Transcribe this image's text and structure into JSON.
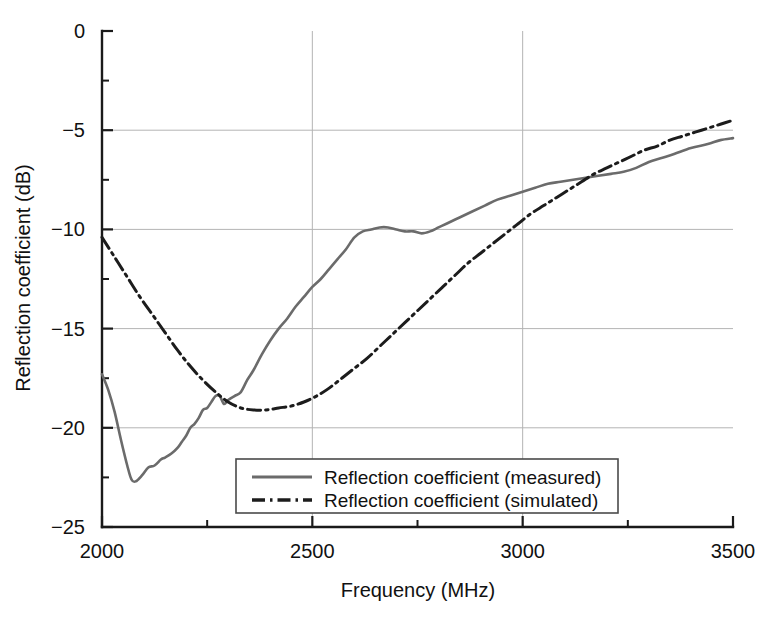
{
  "chart_data": {
    "type": "line",
    "title": "",
    "xlabel": "Frequency (MHz)",
    "ylabel": "Reflection coefficient (dB)",
    "xlim": [
      2000,
      3500
    ],
    "ylim": [
      -25,
      0
    ],
    "xticks": [
      2000,
      2500,
      3000,
      3500
    ],
    "xtick_labels": [
      "2000",
      "2500",
      "3000",
      "3500"
    ],
    "xminor_ticks": [
      2250,
      2750,
      3250
    ],
    "yticks": [
      0,
      -5,
      -10,
      -15,
      -20,
      -25
    ],
    "ytick_labels": [
      "0",
      "−5",
      "−10",
      "−15",
      "−20",
      "−25"
    ],
    "yminor_ticks": [
      -2.5,
      -7.5,
      -12.5,
      -17.5,
      -22.5
    ],
    "grid": true,
    "grid_color": "#b4b4b4",
    "legend_position": "bottom-center",
    "series": [
      {
        "name": "Reflection coefficient (measured)",
        "style": "solid",
        "color": "#6b6b6b",
        "x": [
          2000,
          2015,
          2030,
          2045,
          2060,
          2070,
          2080,
          2095,
          2110,
          2125,
          2140,
          2150,
          2165,
          2180,
          2190,
          2200,
          2210,
          2220,
          2230,
          2240,
          2250,
          2260,
          2270,
          2280,
          2290,
          2300,
          2315,
          2330,
          2345,
          2360,
          2380,
          2400,
          2420,
          2440,
          2460,
          2480,
          2500,
          2520,
          2540,
          2560,
          2580,
          2600,
          2620,
          2640,
          2660,
          2680,
          2700,
          2720,
          2740,
          2760,
          2780,
          2800,
          2820,
          2850,
          2880,
          2910,
          2940,
          2970,
          3000,
          3030,
          3060,
          3090,
          3120,
          3150,
          3180,
          3210,
          3240,
          3270,
          3300,
          3330,
          3360,
          3400,
          3440,
          3470,
          3500
        ],
        "y": [
          -17.3,
          -18.1,
          -19.2,
          -20.6,
          -21.9,
          -22.6,
          -22.7,
          -22.4,
          -22.0,
          -21.9,
          -21.6,
          -21.5,
          -21.3,
          -21.0,
          -20.7,
          -20.4,
          -20.0,
          -19.8,
          -19.5,
          -19.1,
          -19.0,
          -18.7,
          -18.4,
          -18.4,
          -18.8,
          -18.6,
          -18.4,
          -18.2,
          -17.6,
          -17.1,
          -16.3,
          -15.6,
          -15.0,
          -14.5,
          -13.9,
          -13.4,
          -12.9,
          -12.5,
          -12.0,
          -11.5,
          -11.0,
          -10.4,
          -10.1,
          -10.0,
          -9.9,
          -9.9,
          -10.0,
          -10.1,
          -10.1,
          -10.2,
          -10.1,
          -9.9,
          -9.7,
          -9.4,
          -9.1,
          -8.8,
          -8.5,
          -8.3,
          -8.1,
          -7.9,
          -7.7,
          -7.6,
          -7.5,
          -7.4,
          -7.3,
          -7.2,
          -7.1,
          -6.9,
          -6.6,
          -6.4,
          -6.2,
          -5.9,
          -5.7,
          -5.5,
          -5.4
        ]
      },
      {
        "name": "Reflection coefficient (simulated)",
        "style": "dash-dot-dot",
        "color": "#1c1c1c",
        "x": [
          2000,
          2030,
          2060,
          2090,
          2120,
          2150,
          2180,
          2210,
          2240,
          2270,
          2300,
          2330,
          2360,
          2390,
          2420,
          2450,
          2480,
          2510,
          2540,
          2570,
          2600,
          2630,
          2660,
          2690,
          2720,
          2750,
          2780,
          2810,
          2840,
          2870,
          2900,
          2930,
          2960,
          2990,
          3020,
          3050,
          3080,
          3110,
          3140,
          3170,
          3200,
          3230,
          3260,
          3290,
          3320,
          3350,
          3380,
          3410,
          3440,
          3470,
          3500
        ],
        "y": [
          -10.4,
          -11.4,
          -12.4,
          -13.4,
          -14.3,
          -15.2,
          -16.1,
          -16.9,
          -17.6,
          -18.2,
          -18.7,
          -19.0,
          -19.1,
          -19.1,
          -19.0,
          -18.9,
          -18.7,
          -18.4,
          -18.0,
          -17.5,
          -17.0,
          -16.5,
          -15.9,
          -15.3,
          -14.7,
          -14.1,
          -13.5,
          -12.9,
          -12.3,
          -11.7,
          -11.2,
          -10.7,
          -10.2,
          -9.7,
          -9.2,
          -8.8,
          -8.4,
          -8.0,
          -7.6,
          -7.2,
          -6.9,
          -6.6,
          -6.3,
          -6.0,
          -5.8,
          -5.5,
          -5.3,
          -5.1,
          -4.9,
          -4.7,
          -4.5
        ]
      }
    ]
  },
  "legend": {
    "items": [
      {
        "label": "Reflection coefficient (measured)"
      },
      {
        "label": "Reflection coefficient (simulated)"
      }
    ]
  }
}
